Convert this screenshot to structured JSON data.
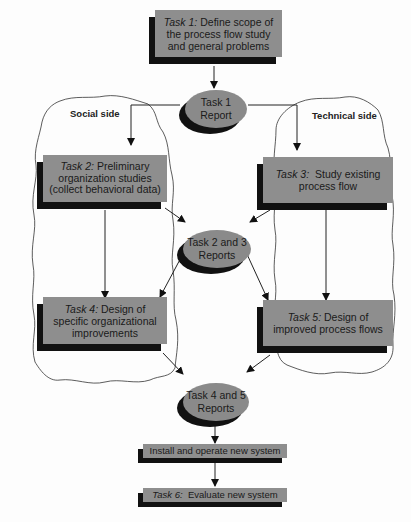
{
  "diagram": {
    "groups": {
      "social": "Social side",
      "technical": "Technical side"
    },
    "nodes": {
      "task1": {
        "prefix": "Task 1:",
        "text": "Define scope of the process flow study and general problems"
      },
      "report1": {
        "line1": "Task 1",
        "line2": "Report"
      },
      "task2": {
        "prefix": "Task 2:",
        "text": "Preliminary organization studies (collect behavioral data)"
      },
      "task3": {
        "prefix": "Task 3:",
        "text": "Study existing process flow"
      },
      "report23": {
        "line1": "Task 2 and 3",
        "line2": "Reports"
      },
      "task4": {
        "prefix": "Task 4:",
        "text": "Design of specific organizational improvements"
      },
      "task5": {
        "prefix": "Task 5:",
        "text": "Design of improved process flows"
      },
      "report45": {
        "line1": "Task 4 and 5",
        "line2": "Reports"
      },
      "install": {
        "text": "Install and operate new system"
      },
      "task6": {
        "prefix": "Task 6:",
        "text": "Evaluate new system"
      }
    },
    "edges": [
      {
        "from": "task1",
        "to": "report1"
      },
      {
        "from": "report1",
        "to": "task2"
      },
      {
        "from": "report1",
        "to": "task3"
      },
      {
        "from": "task2",
        "to": "report23"
      },
      {
        "from": "task3",
        "to": "report23"
      },
      {
        "from": "task2",
        "to": "task4"
      },
      {
        "from": "task3",
        "to": "task5"
      },
      {
        "from": "report23",
        "to": "task4"
      },
      {
        "from": "report23",
        "to": "task5"
      },
      {
        "from": "task4",
        "to": "report45"
      },
      {
        "from": "task5",
        "to": "report45"
      },
      {
        "from": "report45",
        "to": "install"
      },
      {
        "from": "install",
        "to": "task6"
      }
    ],
    "colors": {
      "box_fill": "#8e8e8e",
      "shadow": "#111111",
      "line": "#222222"
    }
  }
}
